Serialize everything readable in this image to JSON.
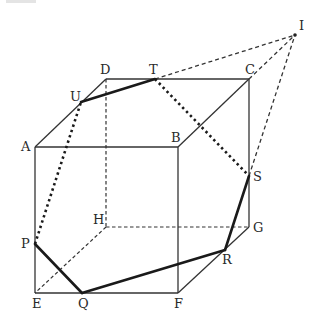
{
  "figure": {
    "type": "cube cross-section diagram",
    "vertices": {
      "A": {
        "label": "A",
        "x": 35,
        "y": 147,
        "label_dx": -14,
        "label_dy": 4
      },
      "B": {
        "label": "B",
        "x": 178,
        "y": 147,
        "label_dx": -7,
        "label_dy": -5
      },
      "C": {
        "label": "C",
        "x": 249,
        "y": 79,
        "label_dx": -4,
        "label_dy": -5
      },
      "D": {
        "label": "D",
        "x": 106,
        "y": 79,
        "label_dx": -6,
        "label_dy": -5
      },
      "E": {
        "label": "E",
        "x": 35,
        "y": 293,
        "label_dx": -3,
        "label_dy": 15
      },
      "F": {
        "label": "F",
        "x": 178,
        "y": 293,
        "label_dx": -4,
        "label_dy": 15
      },
      "G": {
        "label": "G",
        "x": 249,
        "y": 227,
        "label_dx": 4,
        "label_dy": 5
      },
      "H": {
        "label": "H",
        "x": 106,
        "y": 227,
        "label_dx": -13,
        "label_dy": -3
      },
      "P": {
        "label": "P",
        "x": 35,
        "y": 244,
        "label_dx": -14,
        "label_dy": 4
      },
      "Q": {
        "label": "Q",
        "x": 82,
        "y": 293,
        "label_dx": -4,
        "label_dy": 15
      },
      "R": {
        "label": "R",
        "x": 225,
        "y": 250,
        "label_dx": -3,
        "label_dy": 14
      },
      "S": {
        "label": "S",
        "x": 249,
        "y": 176,
        "label_dx": 4,
        "label_dy": 5
      },
      "T": {
        "label": "T",
        "x": 155,
        "y": 79,
        "label_dx": -6,
        "label_dy": -5
      },
      "U": {
        "label": "U",
        "x": 81,
        "y": 102,
        "label_dx": -11,
        "label_dy": -1
      },
      "I": {
        "label": "I",
        "x": 295,
        "y": 35,
        "label_dx": 4,
        "label_dy": -5
      }
    },
    "visible_edges": [
      [
        "A",
        "B"
      ],
      [
        "A",
        "D"
      ],
      [
        "D",
        "C"
      ],
      [
        "B",
        "C"
      ],
      [
        "C",
        "G"
      ],
      [
        "B",
        "F"
      ],
      [
        "A",
        "E"
      ],
      [
        "E",
        "F"
      ],
      [
        "F",
        "G"
      ]
    ],
    "hidden_edges": [
      [
        "D",
        "H"
      ],
      [
        "H",
        "E"
      ],
      [
        "H",
        "G"
      ]
    ],
    "section_visible": [
      [
        "U",
        "T"
      ],
      [
        "S",
        "R"
      ],
      [
        "R",
        "Q"
      ],
      [
        "Q",
        "P"
      ]
    ],
    "section_hidden": [
      [
        "P",
        "U"
      ],
      [
        "T",
        "S"
      ]
    ],
    "extension_lines": [
      [
        "T",
        "I"
      ],
      [
        "C",
        "I"
      ],
      [
        "S",
        "I"
      ]
    ]
  }
}
